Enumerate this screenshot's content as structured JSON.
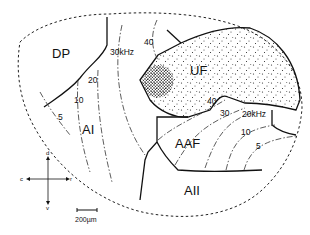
{
  "figure": {
    "type": "auditory cortex tonotopic field map",
    "regions": [
      {
        "id": "dp",
        "label": "DP"
      },
      {
        "id": "ai",
        "label": "AI"
      },
      {
        "id": "uf",
        "label": "UF"
      },
      {
        "id": "aaf",
        "label": "AAF"
      },
      {
        "id": "aii",
        "label": "AII"
      }
    ],
    "ai_isofrequency_labels": [
      "5",
      "10",
      "20",
      "30kHz",
      "40"
    ],
    "aaf_isofrequency_labels": [
      "40",
      "30",
      "20kHz",
      "10",
      "5"
    ],
    "orientation": {
      "dorsal": "d",
      "ventral": "v",
      "caudal": "c",
      "rostral": "r"
    },
    "scale_bar": {
      "label": "200µm"
    }
  }
}
